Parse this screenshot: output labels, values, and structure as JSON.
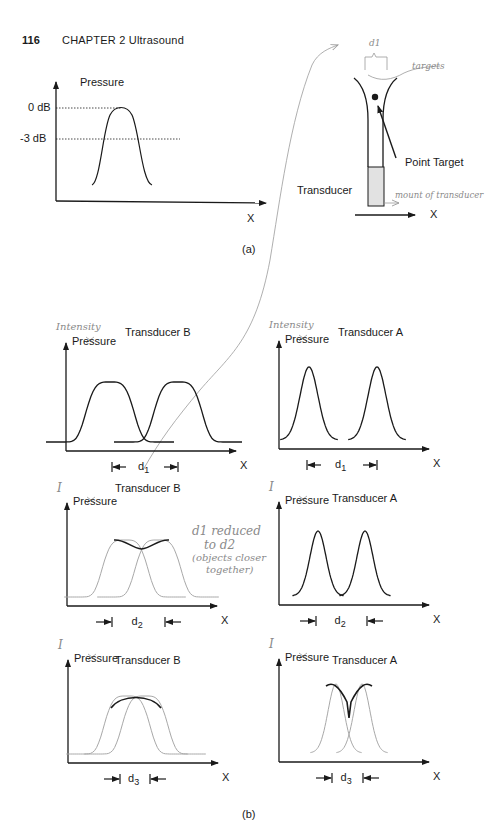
{
  "page": {
    "page_number": "116",
    "running_head": "CHAPTER 2   Ultrasound"
  },
  "figure_a": {
    "caption": "(a)",
    "plot": {
      "y_label": "Pressure",
      "x_label": "X",
      "ticks": [
        "0 dB",
        "-3 dB"
      ]
    },
    "diagram": {
      "transducer_label": "Transducer",
      "point_target_label": "Point Target",
      "x_label": "X",
      "annotations": {
        "d1": "d1",
        "targets": "targets",
        "mount": "mount of transducer"
      }
    }
  },
  "figure_b": {
    "caption": "(b)",
    "panels": [
      {
        "id": "b-row1-B",
        "title": "Transducer B",
        "y_label": "Pressure",
        "handwritten_y": "Intensity",
        "x_label": "X",
        "distance": "d",
        "distance_sub": "1"
      },
      {
        "id": "b-row1-A",
        "title": "Transducer A",
        "y_label": "Pressure",
        "handwritten_y": "Intensity",
        "x_label": "X",
        "distance": "d",
        "distance_sub": "1"
      },
      {
        "id": "b-row2-B",
        "title": "Transducer B",
        "y_label": "Pressure",
        "handwritten_y": "I",
        "x_label": "X",
        "distance": "d",
        "distance_sub": "2"
      },
      {
        "id": "b-row2-A",
        "title": "Transducer A",
        "y_label": "Pressure",
        "handwritten_y": "I",
        "x_label": "X",
        "distance": "d",
        "distance_sub": "2"
      },
      {
        "id": "b-row3-B",
        "title": "Transducer B",
        "y_label": "Pressure",
        "handwritten_y": "I",
        "x_label": "X",
        "distance": "d",
        "distance_sub": "3"
      },
      {
        "id": "b-row3-A",
        "title": "Transducer A",
        "y_label": "Pressure",
        "handwritten_y": "I",
        "x_label": "X",
        "distance": "d",
        "distance_sub": "3"
      }
    ],
    "handwritten_note": [
      "d1 reduced",
      "to d2",
      "(objects closer",
      "together)"
    ]
  },
  "colors": {
    "ink": "#1a1a1a",
    "faint": "#a8a8a8",
    "pencil": "#8a8a8a",
    "transducer_fill": "#e2e2e2"
  }
}
